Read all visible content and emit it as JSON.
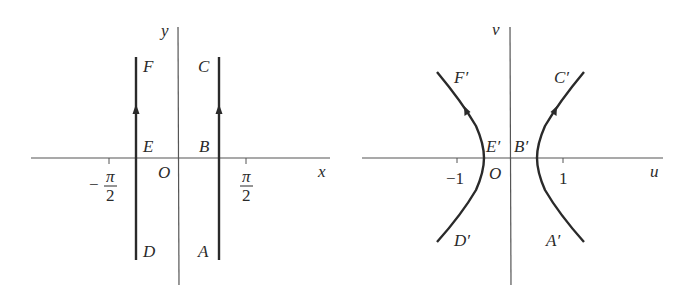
{
  "left_panel": {
    "x_axis_label": "x",
    "y_axis_label": "y",
    "origin_label": "O",
    "tick_neg": {
      "sign": "−",
      "numerator": "π",
      "denominator": "2"
    },
    "tick_pos": {
      "numerator": "π",
      "denominator": "2"
    },
    "points": {
      "A": "A",
      "B": "B",
      "C": "C",
      "D": "D",
      "E": "E",
      "F": "F"
    },
    "description": "Two vertical lines x = -a and x = a (between -π/2 and π/2), traversed upward D→E→F and A→B→C"
  },
  "right_panel": {
    "x_axis_label": "u",
    "y_axis_label": "v",
    "origin_label": "O",
    "tick_neg": "−1",
    "tick_pos": "1",
    "points": {
      "A": "A′",
      "B": "B′",
      "C": "C′",
      "D": "D′",
      "E": "E′",
      "F": "F′"
    },
    "description": "Image under mapping: two branches of a hyperbola, traversed D′→E′→F′ and A′→B′→C′"
  },
  "colors": {
    "curve": "#2a2a2a",
    "axis": "#555555"
  }
}
